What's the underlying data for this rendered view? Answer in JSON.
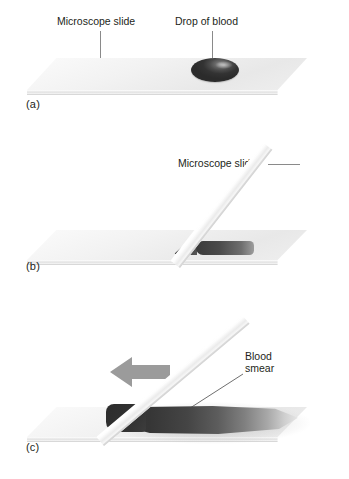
{
  "figure": {
    "background_color": "#ffffff",
    "text_color": "#231f20",
    "leader_color": "#8a8a8a",
    "arrow_color": "#9b9b9b",
    "blood_color": "#333333",
    "slide_color": "#eeeeee"
  },
  "panels": [
    {
      "id": "a",
      "label": "(a)",
      "callouts": [
        {
          "name": "microscope-slide",
          "text": "Microscope slide"
        },
        {
          "name": "drop-of-blood",
          "text": "Drop of blood"
        }
      ]
    },
    {
      "id": "b",
      "label": "(b)",
      "callouts": [
        {
          "name": "microscope-slide",
          "text": "Microscope slide"
        }
      ]
    },
    {
      "id": "c",
      "label": "(c)",
      "callouts": [
        {
          "name": "blood-smear",
          "text": "Blood smear",
          "line1": "Blood",
          "line2": "smear"
        }
      ],
      "arrow": {
        "name": "direction-arrow",
        "direction": "left"
      }
    }
  ]
}
